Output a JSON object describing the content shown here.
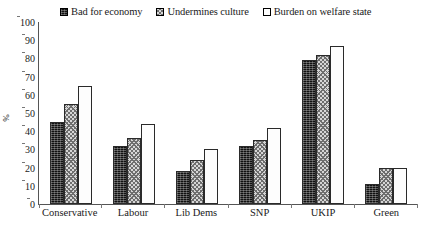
{
  "chart_data": {
    "type": "bar",
    "title": "",
    "subtitle": "",
    "xlabel": "",
    "ylabel": "%",
    "ylim": [
      0,
      100
    ],
    "yticks": [
      0,
      10,
      20,
      30,
      40,
      50,
      60,
      70,
      80,
      90,
      100
    ],
    "grid": false,
    "legend_position": "top",
    "categories": [
      "Conservative",
      "Labour",
      "Lib Dems",
      "SNP",
      "UKIP",
      "Green"
    ],
    "series": [
      {
        "name": "Bad for economy",
        "swatch": "solid-black",
        "values": [
          45,
          32,
          18,
          32,
          79,
          11
        ]
      },
      {
        "name": "Undermines culture",
        "swatch": "grey-crosshatch",
        "values": [
          55,
          36,
          24,
          35,
          82,
          20
        ]
      },
      {
        "name": "Burden on welfare state",
        "swatch": "white-dotted",
        "values": [
          65,
          44,
          30,
          42,
          87,
          20
        ]
      }
    ]
  },
  "axis": {
    "y_label": "%",
    "y_max": 100
  },
  "colors": {
    "series_1": "#111111",
    "series_2": "#d6d6d6",
    "series_3": "#fdfdfd",
    "axis": "#555555",
    "text": "#1a1a1a",
    "background": "#ffffff"
  }
}
